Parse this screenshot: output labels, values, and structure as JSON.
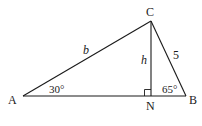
{
  "diagram": {
    "type": "triangle-with-altitude",
    "line_color": "#1a1a1a",
    "vertices": {
      "A": {
        "label": "A",
        "x": 23,
        "y": 96
      },
      "B": {
        "label": "B",
        "x": 186,
        "y": 96
      },
      "C": {
        "label": "C",
        "x": 151,
        "y": 21
      },
      "N": {
        "label": "N",
        "x": 151,
        "y": 96
      }
    },
    "sides": {
      "AC": {
        "label": "b"
      },
      "CB": {
        "label": "5"
      },
      "CN": {
        "label": "h"
      }
    },
    "angles": {
      "A": {
        "label": "30°"
      },
      "B": {
        "label": "65°"
      },
      "N": {
        "label": "right angle"
      }
    }
  }
}
